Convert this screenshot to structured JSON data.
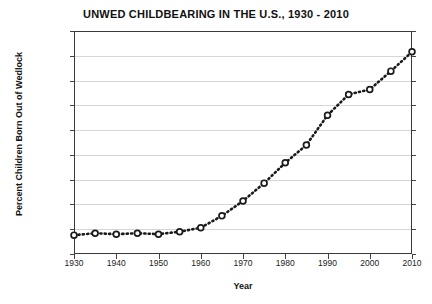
{
  "chart_data": {
    "type": "line",
    "title": "UNWED CHILDBEARING IN THE U.S., 1930 - 2010",
    "xlabel": "Year",
    "ylabel": "Percent Children Born Out of Wedlock",
    "xlim": [
      1930,
      2010
    ],
    "ylim": [
      0,
      45
    ],
    "grid": true,
    "legend": "none",
    "marker": "open-circle",
    "linestyle": "dotted",
    "color": "#1a1a1a",
    "x_ticks": [
      1930,
      1940,
      1950,
      1960,
      1970,
      1980,
      1990,
      2000,
      2010
    ],
    "x_tick_labels": [
      "1930",
      "1940",
      "1950",
      "1960",
      "1970",
      "1980",
      "1990",
      "2000",
      "2010"
    ],
    "y_ticks": [
      0,
      5,
      10,
      15,
      20,
      25,
      30,
      35,
      40,
      45
    ],
    "y_tick_labels": [
      "0%",
      "5%",
      "10%",
      "15%",
      "20%",
      "25%",
      "30%",
      "35%",
      "40%",
      "45%"
    ],
    "x": [
      1930,
      1935,
      1940,
      1945,
      1950,
      1955,
      1960,
      1965,
      1970,
      1975,
      1980,
      1985,
      1990,
      1995,
      2000,
      2005,
      2010
    ],
    "values": [
      3.8,
      4.2,
      4.0,
      4.2,
      4.0,
      4.5,
      5.3,
      7.7,
      10.7,
      14.3,
      18.4,
      22.0,
      28.0,
      32.2,
      33.2,
      36.9,
      40.8
    ]
  }
}
